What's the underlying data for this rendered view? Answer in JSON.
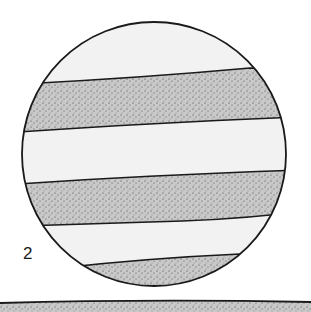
{
  "figure": {
    "label": "2",
    "colors": {
      "background": "#ffffff",
      "zone": "#f2f2f2",
      "belt": "#c9c9c9",
      "stipple": "#3a3a3a",
      "outline": "#1a1a1a"
    }
  }
}
